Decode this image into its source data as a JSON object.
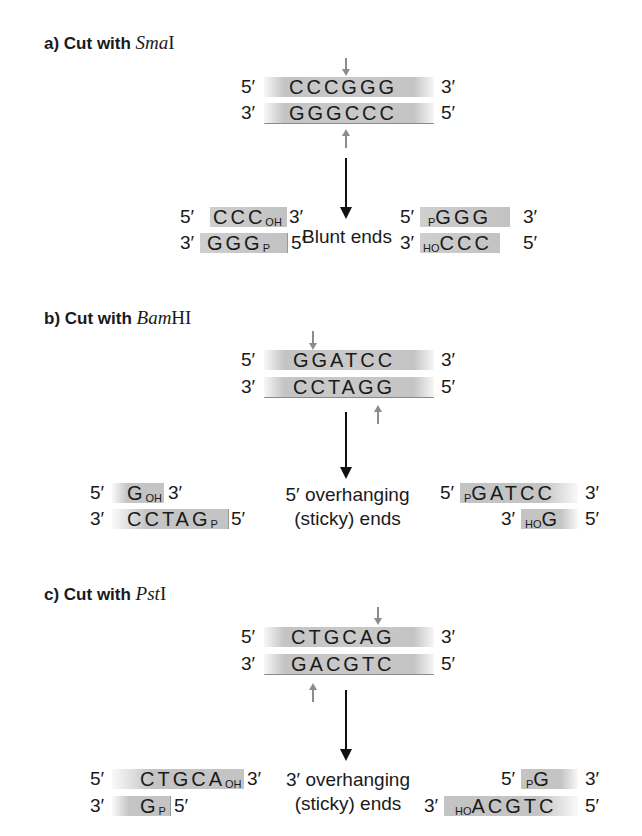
{
  "sections": [
    {
      "id": "a",
      "title_prefix": "a) Cut with ",
      "enzyme_italic": "Sma",
      "enzyme_roman": "I",
      "top_strand": {
        "left_end": "5′",
        "sequence": "CCCGGG",
        "right_end": "3′"
      },
      "bottom_strand": {
        "left_end": "3′",
        "sequence": "GGGCCC",
        "right_end": "5′"
      },
      "result_label_line1": "Blunt ends",
      "result_label_line2": "",
      "left_fragment": {
        "top": {
          "left_end": "5′",
          "sequence": "CCC",
          "terminal": "OH",
          "right_end": "3′"
        },
        "bottom": {
          "left_end": "3′",
          "sequence": "GGG",
          "terminal": "P",
          "right_end": "5′"
        }
      },
      "right_fragment": {
        "top": {
          "left_end": "5′",
          "terminal": "P",
          "sequence": "GGG",
          "right_end": "3′"
        },
        "bottom": {
          "left_end": "3′",
          "terminal": "HO",
          "sequence": "CCC",
          "right_end": "5′"
        }
      }
    },
    {
      "id": "b",
      "title_prefix": "b) Cut with ",
      "enzyme_italic": "Bam",
      "enzyme_roman": "HI",
      "top_strand": {
        "left_end": "5′",
        "sequence": "GGATCC",
        "right_end": "3′"
      },
      "bottom_strand": {
        "left_end": "3′",
        "sequence": "CCTAGG",
        "right_end": "5′"
      },
      "result_label_line1": "5′ overhanging",
      "result_label_line2": "(sticky) ends",
      "left_fragment": {
        "top": {
          "left_end": "5′",
          "sequence": "G",
          "terminal": "OH",
          "right_end": "3′"
        },
        "bottom": {
          "left_end": "3′",
          "sequence": "CCTAG",
          "terminal": "P",
          "right_end": "5′"
        }
      },
      "right_fragment": {
        "top": {
          "left_end": "5′",
          "terminal": "P",
          "sequence": "GATCC",
          "right_end": "3′"
        },
        "bottom": {
          "left_end": "3′",
          "terminal": "HO",
          "sequence": "G",
          "right_end": "5′"
        }
      }
    },
    {
      "id": "c",
      "title_prefix": "c) Cut with ",
      "enzyme_italic": "Pst",
      "enzyme_roman": "I",
      "top_strand": {
        "left_end": "5′",
        "sequence": "CTGCAG",
        "right_end": "3′"
      },
      "bottom_strand": {
        "left_end": "3′",
        "sequence": "GACGTC",
        "right_end": "5′"
      },
      "result_label_line1": "3′ overhanging",
      "result_label_line2": "(sticky) ends",
      "left_fragment": {
        "top": {
          "left_end": "5′",
          "sequence": "CTGCA",
          "terminal": "OH",
          "right_end": "3′"
        },
        "bottom": {
          "left_end": "3′",
          "sequence": "G",
          "terminal": "P",
          "right_end": "5′"
        }
      },
      "right_fragment": {
        "top": {
          "left_end": "5′",
          "terminal": "P",
          "sequence": "G",
          "right_end": "3′"
        },
        "bottom": {
          "left_end": "3′",
          "terminal": "HO",
          "sequence": "ACGTC",
          "right_end": "5′"
        }
      }
    }
  ],
  "colors": {
    "strand_fill": "#c6c6c6",
    "cut_arrow": "#8c8c8c",
    "main_arrow": "#111111",
    "text": "#1a1a1a"
  }
}
